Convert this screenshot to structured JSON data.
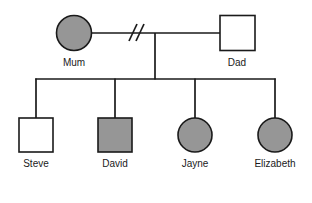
{
  "diagram": {
    "type": "pedigree-chart",
    "background_color": "#ffffff",
    "line_color": "#1a1a1a",
    "affected_fill_color": "#969696",
    "unaffected_fill_color": "#ffffff",
    "legend": {
      "square_meaning": "male",
      "circle_meaning": "female",
      "shaded_meaning": "affected",
      "unshaded_meaning": "unaffected",
      "double_slash_meaning": "relationship-ended"
    },
    "generations": [
      {
        "name": "generation-1",
        "label": "parents",
        "members": [
          {
            "id": "mum",
            "label": "Mum",
            "sex": "female",
            "shape": "circle",
            "affected": true,
            "fill": "#969696",
            "cx": 74,
            "cy": 33,
            "r": 17.5,
            "label_x": 74,
            "label_y": 66
          },
          {
            "id": "dad",
            "label": "Dad",
            "sex": "male",
            "shape": "square",
            "affected": false,
            "fill": "#ffffff",
            "x": 220,
            "y": 15.5,
            "size": 35,
            "label_x": 237,
            "label_y": 66
          }
        ]
      },
      {
        "name": "generation-2",
        "label": "children",
        "members": [
          {
            "id": "steve",
            "label": "Steve",
            "sex": "male",
            "shape": "square",
            "affected": false,
            "fill": "#ffffff",
            "x": 19,
            "y": 118,
            "size": 34,
            "label_x": 36,
            "label_y": 167
          },
          {
            "id": "david",
            "label": "David",
            "sex": "male",
            "shape": "square",
            "affected": true,
            "fill": "#969696",
            "x": 98,
            "y": 118,
            "size": 34,
            "label_x": 115,
            "label_y": 167
          },
          {
            "id": "jayne",
            "label": "Jayne",
            "sex": "female",
            "shape": "circle",
            "affected": true,
            "fill": "#969696",
            "cx": 195,
            "cy": 135,
            "r": 17,
            "label_x": 195,
            "label_y": 167
          },
          {
            "id": "elizabeth",
            "label": "Elizabeth",
            "sex": "female",
            "shape": "circle",
            "affected": true,
            "fill": "#969696",
            "cx": 275,
            "cy": 135,
            "r": 17,
            "label_x": 275,
            "label_y": 167
          }
        ]
      }
    ],
    "connections": {
      "mating_line": {
        "id": "mum-dad-partnership",
        "x1": 91.5,
        "x2": 220,
        "y": 33,
        "relationship_status": "separated"
      },
      "divorce_marks": [
        {
          "x1": 129,
          "y1": 41,
          "x2": 137,
          "y2": 24
        },
        {
          "x1": 136,
          "y1": 41,
          "x2": 144,
          "y2": 24
        }
      ],
      "descent_line": {
        "x": 155,
        "y1": 33,
        "y2": 79
      },
      "sibship_bar": {
        "x1": 36,
        "x2": 275,
        "y": 79
      },
      "child_drop_lines": [
        {
          "child": "steve",
          "x": 36,
          "y1": 79,
          "y2": 118
        },
        {
          "child": "david",
          "x": 115,
          "y1": 79,
          "y2": 118
        },
        {
          "child": "jayne",
          "x": 195,
          "y1": 79,
          "y2": 118
        },
        {
          "child": "elizabeth",
          "x": 275,
          "y1": 79,
          "y2": 118
        }
      ]
    }
  }
}
